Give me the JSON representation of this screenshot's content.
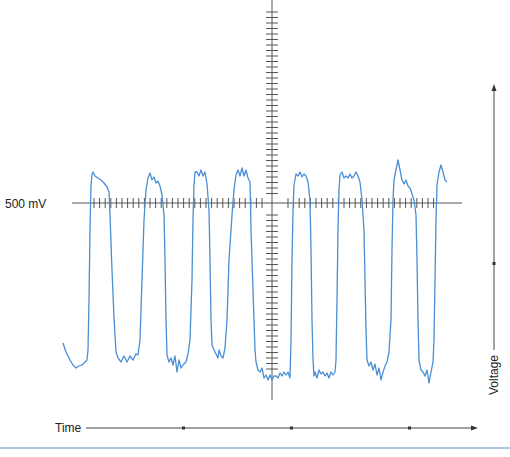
{
  "chart_data": {
    "type": "line",
    "title": "",
    "xlabel": "Time",
    "ylabel": "Voltage",
    "reference_label": "500 mV",
    "reference_value_mV": 500,
    "grid": false,
    "legend": null,
    "series": [
      {
        "name": "signal",
        "color": "#4a8fd4",
        "points": [
          [
            63,
            343
          ],
          [
            66,
            352
          ],
          [
            70,
            360
          ],
          [
            73,
            365
          ],
          [
            76,
            368
          ],
          [
            79,
            366
          ],
          [
            82,
            365
          ],
          [
            85,
            362
          ],
          [
            87,
            360
          ],
          [
            88,
            350
          ],
          [
            89,
            300
          ],
          [
            90,
            230
          ],
          [
            91,
            185
          ],
          [
            92,
            175
          ],
          [
            93,
            172
          ],
          [
            95,
            176
          ],
          [
            98,
            178
          ],
          [
            101,
            180
          ],
          [
            104,
            183
          ],
          [
            107,
            187
          ],
          [
            109,
            192
          ],
          [
            110,
            215
          ],
          [
            112,
            270
          ],
          [
            114,
            318
          ],
          [
            116,
            352
          ],
          [
            118,
            358
          ],
          [
            121,
            362
          ],
          [
            124,
            356
          ],
          [
            127,
            362
          ],
          [
            130,
            356
          ],
          [
            133,
            360
          ],
          [
            136,
            354
          ],
          [
            138,
            355
          ],
          [
            140,
            340
          ],
          [
            142,
            280
          ],
          [
            144,
            220
          ],
          [
            146,
            190
          ],
          [
            148,
            178
          ],
          [
            150,
            173
          ],
          [
            152,
            180
          ],
          [
            154,
            177
          ],
          [
            156,
            183
          ],
          [
            158,
            181
          ],
          [
            160,
            186
          ],
          [
            162,
            195
          ],
          [
            164,
            215
          ],
          [
            165,
            260
          ],
          [
            166,
            320
          ],
          [
            167,
            355
          ],
          [
            169,
            362
          ],
          [
            171,
            358
          ],
          [
            173,
            365
          ],
          [
            175,
            356
          ],
          [
            177,
            372
          ],
          [
            179,
            360
          ],
          [
            181,
            368
          ],
          [
            183,
            365
          ],
          [
            186,
            362
          ],
          [
            188,
            354
          ],
          [
            190,
            340
          ],
          [
            192,
            280
          ],
          [
            193,
            220
          ],
          [
            194,
            185
          ],
          [
            195,
            172
          ],
          [
            197,
            172
          ],
          [
            199,
            176
          ],
          [
            201,
            170
          ],
          [
            203,
            176
          ],
          [
            205,
            172
          ],
          [
            207,
            184
          ],
          [
            209,
            210
          ],
          [
            210,
            260
          ],
          [
            211,
            320
          ],
          [
            212,
            345
          ],
          [
            214,
            350
          ],
          [
            216,
            354
          ],
          [
            218,
            358
          ],
          [
            219,
            350
          ],
          [
            221,
            356
          ],
          [
            223,
            358
          ],
          [
            225,
            348
          ],
          [
            227,
            320
          ],
          [
            229,
            260
          ],
          [
            232,
            215
          ],
          [
            234,
            190
          ],
          [
            236,
            175
          ],
          [
            238,
            170
          ],
          [
            240,
            176
          ],
          [
            242,
            168
          ],
          [
            244,
            176
          ],
          [
            246,
            170
          ],
          [
            248,
            178
          ],
          [
            250,
            182
          ],
          [
            251,
            230
          ],
          [
            252,
            260
          ],
          [
            253,
            290
          ],
          [
            254,
            320
          ],
          [
            255,
            350
          ],
          [
            256,
            362
          ],
          [
            258,
            370
          ],
          [
            260,
            372
          ],
          [
            262,
            368
          ],
          [
            264,
            378
          ],
          [
            266,
            375
          ],
          [
            268,
            380
          ],
          [
            270,
            375
          ],
          [
            272,
            380
          ],
          [
            274,
            376
          ],
          [
            276,
            376
          ],
          [
            278,
            378
          ],
          [
            280,
            373
          ],
          [
            282,
            376
          ],
          [
            284,
            372
          ],
          [
            286,
            375
          ],
          [
            288,
            372
          ],
          [
            290,
            378
          ],
          [
            291,
            340
          ],
          [
            292,
            260
          ],
          [
            293,
            210
          ],
          [
            294,
            185
          ],
          [
            296,
            174
          ],
          [
            298,
            176
          ],
          [
            300,
            172
          ],
          [
            302,
            177
          ],
          [
            304,
            174
          ],
          [
            306,
            176
          ],
          [
            308,
            182
          ],
          [
            310,
            200
          ],
          [
            311,
            250
          ],
          [
            312,
            320
          ],
          [
            313,
            360
          ],
          [
            314,
            376
          ],
          [
            315,
            372
          ],
          [
            317,
            378
          ],
          [
            319,
            370
          ],
          [
            321,
            374
          ],
          [
            323,
            372
          ],
          [
            325,
            376
          ],
          [
            327,
            373
          ],
          [
            329,
            378
          ],
          [
            331,
            372
          ],
          [
            333,
            375
          ],
          [
            335,
            372
          ],
          [
            336,
            360
          ],
          [
            337,
            300
          ],
          [
            338,
            230
          ],
          [
            339,
            190
          ],
          [
            340,
            175
          ],
          [
            342,
            172
          ],
          [
            344,
            178
          ],
          [
            346,
            176
          ],
          [
            348,
            178
          ],
          [
            350,
            174
          ],
          [
            352,
            178
          ],
          [
            354,
            176
          ],
          [
            356,
            172
          ],
          [
            358,
            176
          ],
          [
            360,
            182
          ],
          [
            362,
            200
          ],
          [
            364,
            230
          ],
          [
            365,
            280
          ],
          [
            366,
            330
          ],
          [
            367,
            360
          ],
          [
            369,
            366
          ],
          [
            371,
            362
          ],
          [
            373,
            370
          ],
          [
            375,
            364
          ],
          [
            377,
            375
          ],
          [
            379,
            368
          ],
          [
            381,
            380
          ],
          [
            383,
            372
          ],
          [
            385,
            366
          ],
          [
            387,
            362
          ],
          [
            389,
            352
          ],
          [
            391,
            320
          ],
          [
            392,
            250
          ],
          [
            393,
            200
          ],
          [
            394,
            180
          ],
          [
            396,
            170
          ],
          [
            398,
            160
          ],
          [
            400,
            170
          ],
          [
            402,
            180
          ],
          [
            404,
            184
          ],
          [
            406,
            180
          ],
          [
            408,
            186
          ],
          [
            410,
            188
          ],
          [
            412,
            194
          ],
          [
            414,
            200
          ],
          [
            416,
            215
          ],
          [
            417,
            260
          ],
          [
            418,
            320
          ],
          [
            419,
            360
          ],
          [
            421,
            370
          ],
          [
            423,
            372
          ],
          [
            425,
            376
          ],
          [
            427,
            370
          ],
          [
            429,
            383
          ],
          [
            431,
            372
          ],
          [
            433,
            362
          ],
          [
            434,
            340
          ],
          [
            435,
            280
          ],
          [
            436,
            220
          ],
          [
            437,
            185
          ],
          [
            439,
            172
          ],
          [
            441,
            165
          ],
          [
            443,
            172
          ],
          [
            445,
            180
          ],
          [
            447,
            182
          ]
        ]
      }
    ],
    "axes": {
      "center_x": 272,
      "reference_y": 203,
      "horizontal_ticks": {
        "count_left": 31,
        "count_right": 27,
        "spacing_px": 5.6
      },
      "vertical_ticks": {
        "count_up": 34,
        "count_down": 34,
        "spacing_px": 5.5
      }
    }
  },
  "labels": {
    "reference": "500 mV",
    "time_axis": "Time",
    "voltage_axis": "Voltage"
  }
}
